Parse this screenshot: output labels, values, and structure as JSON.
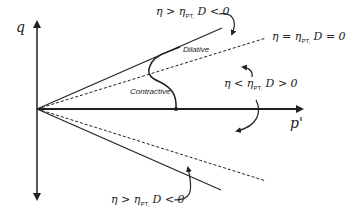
{
  "diagram": {
    "type": "stress-path q vs p'",
    "axes": {
      "y_label": "q",
      "x_label": "p'"
    },
    "regions": {
      "dilative": "Dilative",
      "contractive": "Contractive"
    },
    "annotations": {
      "upper_top": {
        "eta": "η > η",
        "sub": "PT,",
        "d": " D < 0"
      },
      "phase_line": {
        "eta": "η = η",
        "sub": "PT,",
        "d": " D = 0"
      },
      "middle": {
        "eta": "η < η",
        "sub": "PT,",
        "d": " D > 0"
      },
      "lower": {
        "eta": "η > η",
        "sub": "PT,",
        "d": " D < 0"
      }
    },
    "colors": {
      "line": "#222222",
      "background": "#ffffff"
    }
  }
}
